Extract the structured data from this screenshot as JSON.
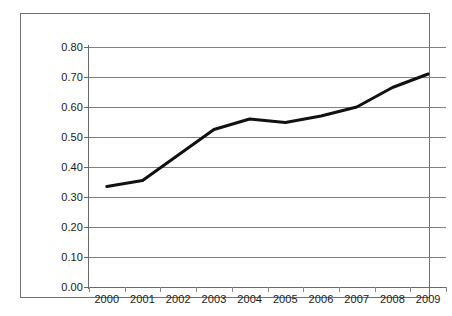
{
  "chart_data": {
    "type": "line",
    "title": "",
    "subtitle": "",
    "xlabel": "",
    "ylabel": "",
    "categories": [
      "2000",
      "2001",
      "2002",
      "2003",
      "2004",
      "2005",
      "2006",
      "2007",
      "2008",
      "2009"
    ],
    "values": [
      0.335,
      0.355,
      0.44,
      0.525,
      0.56,
      0.548,
      0.57,
      0.6,
      0.665,
      0.71
    ],
    "series": [
      {
        "name": "",
        "values": [
          0.335,
          0.355,
          0.44,
          0.525,
          0.56,
          0.548,
          0.57,
          0.6,
          0.665,
          0.71
        ]
      }
    ],
    "ylim": [
      0.0,
      0.8
    ],
    "ytick_step": 0.1,
    "ytick_labels": [
      "0.00",
      "0.10",
      "0.20",
      "0.30",
      "0.40",
      "0.50",
      "0.60",
      "0.70",
      "0.80"
    ],
    "ytick_values": [
      0.0,
      0.1,
      0.2,
      0.3,
      0.4,
      0.5,
      0.6,
      0.7,
      0.8
    ],
    "xtick_labels": [
      "2000",
      "2001",
      "2002",
      "2003",
      "2004",
      "2005",
      "2006",
      "2007",
      "2008",
      "2009"
    ],
    "grid": true,
    "grid_axis": "y",
    "legend": false,
    "legend_position": "none",
    "annotations": [],
    "colors": {
      "series_line": "#111111",
      "gridline": "#808080",
      "axis": "#6a6a6a",
      "frame": "#6f6f6f",
      "text": "#1a1a1a",
      "background": "#ffffff"
    },
    "line_width": 3
  }
}
